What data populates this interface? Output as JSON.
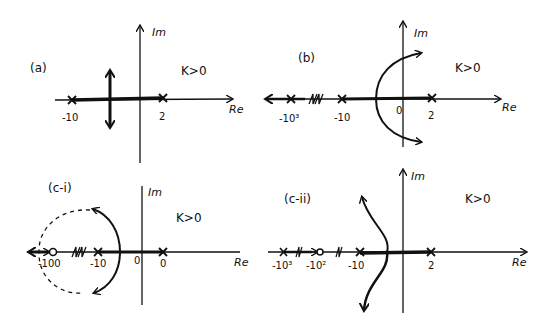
{
  "panels": {
    "a": {
      "tag": "(a)",
      "gain": "K>0",
      "im_label": "Im",
      "re_label": "Re",
      "poles": [
        {
          "value": "-10"
        },
        {
          "value": "2"
        }
      ],
      "ticks": [
        "-10",
        "2"
      ]
    },
    "b": {
      "tag": "(b)",
      "gain": "K>0",
      "im_label": "Im",
      "re_label": "Re",
      "poles": [
        {
          "value": "-10³"
        },
        {
          "value": "-10"
        },
        {
          "value": "2"
        }
      ],
      "ticks": [
        "-10³",
        "-10",
        "0",
        "2"
      ],
      "axis_break": "//"
    },
    "c_i": {
      "tag": "(c-i)",
      "gain": "K>0",
      "im_label": "Im",
      "re_label": "Re",
      "poles": [
        {
          "value": "-10"
        },
        {
          "value": "0"
        }
      ],
      "zeros": [
        {
          "value": "-100"
        }
      ],
      "ticks": [
        "-100",
        "-10",
        "0",
        "0"
      ],
      "axis_break": "//"
    },
    "c_ii": {
      "tag": "(c-ii)",
      "gain": "K>0",
      "im_label": "Im",
      "re_label": "Re",
      "poles": [
        {
          "value": "-10³"
        },
        {
          "value": "-10"
        },
        {
          "value": "2"
        }
      ],
      "zeros": [
        {
          "value": "-10²"
        }
      ],
      "ticks": [
        "-10³",
        "-10²",
        "-10",
        "2"
      ],
      "axis_break": "//"
    }
  },
  "colors": {
    "ink": "#111111",
    "background": "#ffffff"
  }
}
